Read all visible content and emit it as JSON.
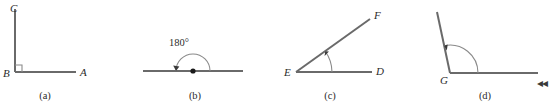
{
  "figure": {
    "background_color": "#ffffff",
    "stroke_color": "#6a6a6a",
    "mark_color": "#3a3a3a",
    "text_color": "#2b2b2b",
    "width": 558,
    "height": 108,
    "panels": [
      {
        "id": "a",
        "caption": "(a)",
        "angle_type": "right",
        "vertex_label": "B",
        "ray_labels": [
          "C",
          "A"
        ],
        "marker": "right-angle-square",
        "labels": {
          "C": "C",
          "B": "B",
          "A": "A"
        }
      },
      {
        "id": "b",
        "caption": "(b)",
        "angle_type": "straight",
        "vertex_label": "",
        "ray_labels": [],
        "marker": "arc-with-arrow",
        "angle_measure": "180°",
        "labels": {}
      },
      {
        "id": "c",
        "caption": "(c)",
        "angle_type": "acute",
        "vertex_label": "E",
        "ray_labels": [
          "F",
          "D"
        ],
        "marker": "arc-with-arrow",
        "labels": {
          "F": "F",
          "E": "E",
          "D": "D"
        }
      },
      {
        "id": "d",
        "caption": "(d)",
        "angle_type": "obtuse",
        "vertex_label": "G",
        "ray_labels": [],
        "marker": "arc-with-arrow",
        "labels": {
          "G": "G"
        }
      }
    ],
    "edge_glyph": "◂◂"
  }
}
